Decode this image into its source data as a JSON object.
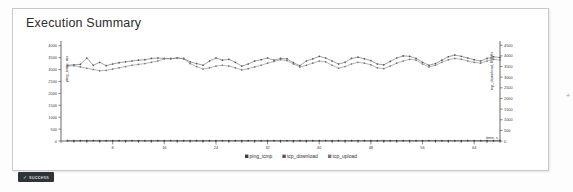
{
  "panel": {
    "title": "Execution Summary",
    "status_badge": {
      "label": "success",
      "check_glyph": "✓"
    }
  },
  "chart_data": {
    "type": "line",
    "title": "Execution Summary",
    "xlabel": "time, s",
    "ylabel_left": "ping_icmp, ms",
    "ylabel_right": "tcp_download, Mbit/s",
    "grid": false,
    "legend_position": "bottom",
    "xlim": [
      0,
      68
    ],
    "xticks": [
      8,
      16,
      24,
      32,
      40,
      48,
      56,
      64
    ],
    "ylim_left": [
      0,
      4200
    ],
    "yticks_left": [
      0,
      500,
      1000,
      1500,
      2000,
      2500,
      3000,
      3500,
      4000
    ],
    "ylim_right": [
      0,
      4700
    ],
    "yticks_right": [
      0,
      500,
      1000,
      1500,
      2000,
      2500,
      3000,
      3500,
      4000,
      4500
    ],
    "colors": {
      "ping_icmp": "#3a3a3a",
      "tcp_download": "#555555",
      "tcp_upload": "#777777"
    },
    "x": [
      1,
      2,
      3,
      4,
      5,
      6,
      7,
      8,
      9,
      10,
      11,
      12,
      13,
      14,
      15,
      16,
      17,
      18,
      19,
      20,
      21,
      22,
      23,
      24,
      25,
      26,
      27,
      28,
      29,
      30,
      31,
      32,
      33,
      34,
      35,
      36,
      37,
      38,
      39,
      40,
      41,
      42,
      43,
      44,
      45,
      46,
      47,
      48,
      49,
      50,
      51,
      52,
      53,
      54,
      55,
      56,
      57,
      58,
      59,
      60,
      61,
      62,
      63,
      64,
      65,
      66,
      67,
      68
    ],
    "series": [
      {
        "name": "ping_icmp",
        "axis": "left",
        "values": [
          14,
          13,
          15,
          14,
          16,
          13,
          14,
          15,
          13,
          14,
          16,
          15,
          14,
          13,
          15,
          14,
          16,
          14,
          13,
          15,
          14,
          15,
          13,
          14,
          16,
          15,
          14,
          13,
          15,
          16,
          14,
          13,
          15,
          14,
          16,
          15,
          13,
          14,
          15,
          14,
          16,
          13,
          15,
          14,
          13,
          16,
          15,
          14,
          13,
          15,
          14,
          16,
          13,
          15,
          14,
          13,
          16,
          15,
          14,
          13,
          15,
          14,
          16,
          13,
          15,
          14,
          13,
          15
        ]
      },
      {
        "name": "tcp_download",
        "axis": "right",
        "values": [
          3560,
          3580,
          3600,
          3900,
          3560,
          3700,
          3540,
          3620,
          3680,
          3720,
          3760,
          3800,
          3820,
          3880,
          3900,
          3880,
          3860,
          3900,
          3880,
          3720,
          3640,
          3560,
          3760,
          3900,
          3800,
          3840,
          3700,
          3520,
          3620,
          3760,
          3820,
          3900,
          3800,
          3880,
          3860,
          3680,
          3540,
          3760,
          3860,
          3980,
          3900,
          3760,
          3620,
          3700,
          3880,
          3940,
          3860,
          3780,
          3620,
          3580,
          3740,
          3900,
          4000,
          3980,
          3880,
          3700,
          3560,
          3640,
          3800,
          3960,
          4040,
          3980,
          3900,
          3820,
          3760,
          3880,
          3960,
          3920
        ]
      },
      {
        "name": "tcp_upload",
        "axis": "right",
        "values": [
          3520,
          3540,
          3480,
          3420,
          3360,
          3300,
          3320,
          3380,
          3440,
          3500,
          3560,
          3600,
          3640,
          3700,
          3760,
          3860,
          3880,
          3900,
          3860,
          3640,
          3500,
          3380,
          3440,
          3520,
          3560,
          3520,
          3440,
          3340,
          3400,
          3480,
          3560,
          3660,
          3740,
          3820,
          3780,
          3620,
          3480,
          3560,
          3660,
          3760,
          3720,
          3560,
          3420,
          3500,
          3620,
          3700,
          3660,
          3580,
          3440,
          3400,
          3520,
          3660,
          3760,
          3840,
          3800,
          3620,
          3480,
          3560,
          3700,
          3820,
          3880,
          3840,
          3760,
          3700,
          3660,
          3760,
          3840,
          3800
        ]
      }
    ],
    "legend": [
      {
        "label": "ping_icmp",
        "color": "#3a3a3a"
      },
      {
        "label": "tcp_download",
        "color": "#555555"
      },
      {
        "label": "tcp_upload",
        "color": "#777777"
      }
    ]
  }
}
